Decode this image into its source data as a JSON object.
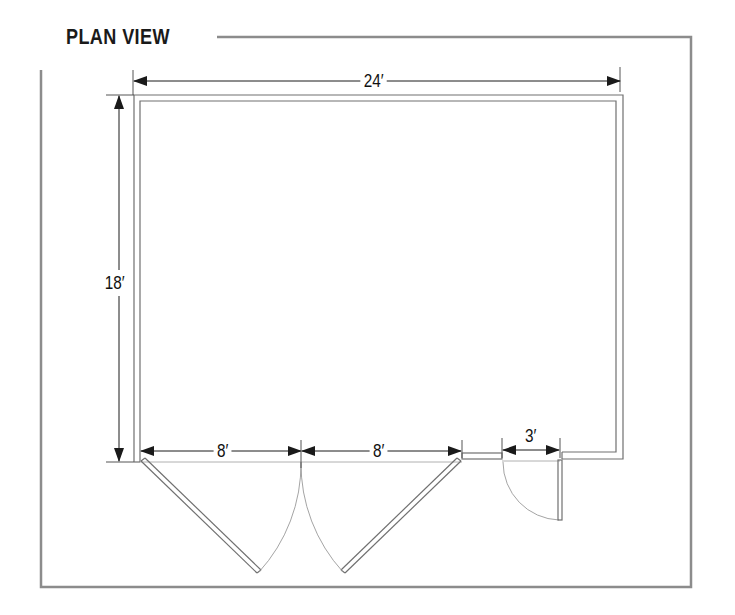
{
  "title": "PLAN VIEW",
  "colors": {
    "frame": "#8c8c8c",
    "wall": "#707070",
    "dimension": "#1a1a1a",
    "swing_arc": "#9a9a9a",
    "background": "#ffffff"
  },
  "dimensions": {
    "width": "24′",
    "depth": "18′",
    "left_door": "8′",
    "right_door": "8′",
    "walk_door": "3′"
  },
  "elements": {
    "room": "rectangular building footprint",
    "double_door": "two 8-foot swinging door leaves opening outward",
    "walk_door": "single 3-foot door swinging outward"
  }
}
